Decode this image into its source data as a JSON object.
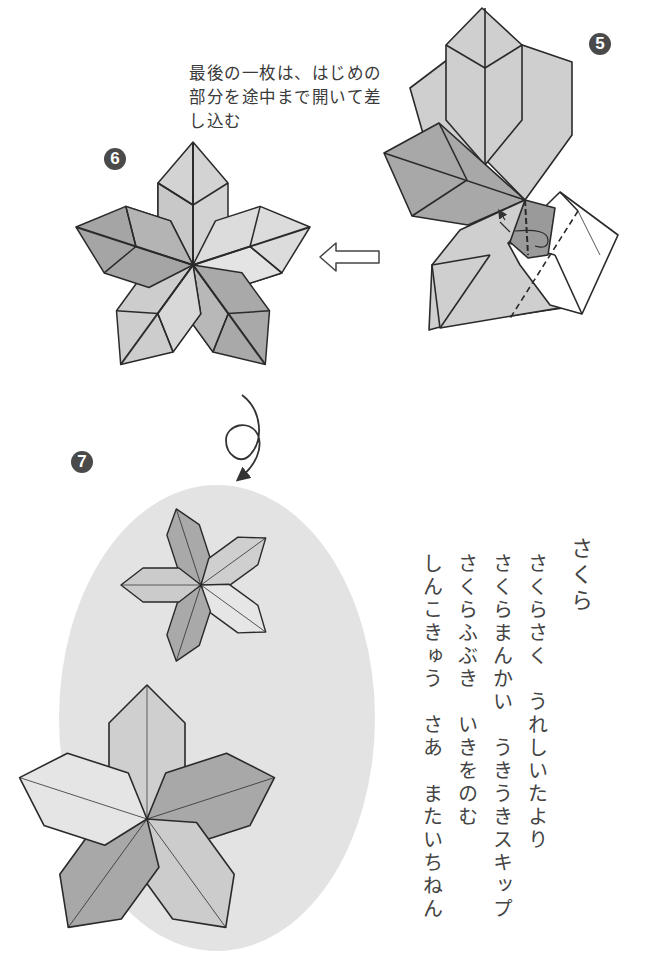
{
  "page": {
    "type": "origami-instruction",
    "steps": [
      {
        "number": "5",
        "badge_label": "5"
      },
      {
        "number": "6",
        "badge_label": "6"
      },
      {
        "number": "7",
        "badge_label": "7"
      }
    ],
    "instruction_lines": [
      "最後の一枚は、はじめの",
      "部分を途中まで開いて差",
      "し込む"
    ],
    "icons": {
      "hollow_arrow": "left-hollow-arrow-icon",
      "turn_over": "turn-over-loop-arrow-icon",
      "insert_arrow": "insert-arrow-icon"
    },
    "colors": {
      "dark_petal": "#a6a6a6",
      "mid_petal": "#c6c6c6",
      "light_petal": "#dedede",
      "background_oval": "#e2e2e2",
      "outline": "#2a2a2a",
      "badge": "#4a4a4a"
    }
  },
  "poem": {
    "title": "さくら",
    "lines": [
      "さくらさく　うれしいたより",
      "さくらまんかい　うきうきスキップ",
      "さくらふぶき　いきをのむ",
      "しんこきゅう　さあ　またいちねん"
    ]
  }
}
